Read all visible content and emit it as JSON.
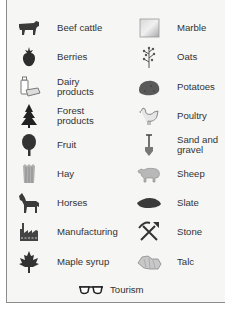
{
  "legend": {
    "left_column": [
      {
        "label": "Beef cattle",
        "icon": "cattle-icon"
      },
      {
        "label": "Berries",
        "icon": "berry-icon"
      },
      {
        "label": "Dairy\nproducts",
        "icon": "dairy-icon"
      },
      {
        "label": "Forest\nproducts",
        "icon": "tree-conifer-icon"
      },
      {
        "label": "Fruit",
        "icon": "fruit-tree-icon"
      },
      {
        "label": "Hay",
        "icon": "hay-icon"
      },
      {
        "label": "Horses",
        "icon": "horse-icon"
      },
      {
        "label": "Manufacturing",
        "icon": "factory-icon"
      },
      {
        "label": "Maple syrup",
        "icon": "maple-leaf-icon"
      }
    ],
    "right_column": [
      {
        "label": "Marble",
        "icon": "marble-icon"
      },
      {
        "label": "Oats",
        "icon": "oats-icon"
      },
      {
        "label": "Potatoes",
        "icon": "potato-icon"
      },
      {
        "label": "Poultry",
        "icon": "chicken-icon"
      },
      {
        "label": "Sand and\ngravel",
        "icon": "shovel-icon"
      },
      {
        "label": "Sheep",
        "icon": "sheep-icon"
      },
      {
        "label": "Slate",
        "icon": "slate-icon"
      },
      {
        "label": "Stone",
        "icon": "pickaxe-icon"
      },
      {
        "label": "Talc",
        "icon": "talc-icon"
      }
    ],
    "bottom": {
      "label": "Tourism",
      "icon": "sunglasses-icon"
    }
  },
  "colors": {
    "background": "#f6f6f5",
    "border": "#8c8c8c",
    "icon_dark": "#3a3a3a",
    "icon_mid": "#6e6e6e",
    "icon_light": "#b8b8b8"
  }
}
